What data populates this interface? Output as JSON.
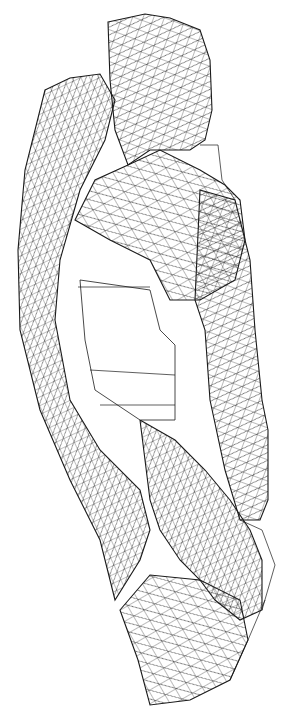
{
  "image": {
    "subject": "wireframe triangle mesh of a 3D scanned object",
    "background_color": "#ffffff",
    "line_color": "#1a1a1a",
    "width": 295,
    "height": 724
  },
  "regions": [
    {
      "name": "top-block",
      "points": "108,22 145,14 170,18 200,30 210,60 212,110 205,140 190,150 150,150 128,165 115,130 110,80"
    },
    {
      "name": "left-band",
      "points": "45,90 70,78 100,74 115,100 105,140 80,190 60,260 55,320 70,400 100,450 140,490 150,530 140,560 115,600 100,540 70,480 40,410 20,330 18,250 25,170"
    },
    {
      "name": "upper-mid",
      "points": "75,220 95,180 128,165 160,150 200,170 225,185 240,200 245,240 235,280 200,300 170,300 150,260 110,240"
    },
    {
      "name": "right-column",
      "points": "200,190 235,200 250,260 255,330 262,400 268,430 268,500 260,520 240,520 225,470 210,400 205,330 195,300"
    },
    {
      "name": "lower-mid",
      "points": "140,420 175,440 205,470 230,500 250,530 262,560 262,610 240,620 215,600 200,580 180,560 160,530 150,500"
    },
    {
      "name": "bottom-block",
      "points": "120,610 150,575 200,580 240,600 248,640 230,680 190,700 150,705 138,660"
    }
  ],
  "inner_opening": {
    "points": "80,280 150,290 160,330 175,345 175,420 140,420 95,390 85,340"
  }
}
